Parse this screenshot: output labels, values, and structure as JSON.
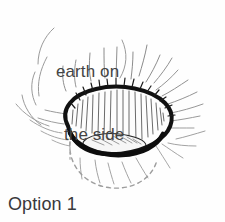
{
  "figure": {
    "title": "Option 1",
    "kind": "hand-drawn sketch diagram",
    "background_color": "#fefefe",
    "ink_color": "#1a1a1a",
    "sketch_line_color": "#8d8d8d",
    "text_color": "#3b3b3b"
  },
  "annotation": {
    "label_line_1": "earth on",
    "label_line_2": "the side",
    "full_text": "earth on the side",
    "leader_line_color": "#9a9a9a"
  },
  "caption": {
    "text": "Option 1"
  },
  "drawing": {
    "rim_label": "crater-rim",
    "rim_stroke_color": "#111111",
    "rim_stroke_width": 4,
    "inner_wall_label": "crater-inner-wall-hatching",
    "hatch_color": "#4a4a4a",
    "floor_label": "crater-floor",
    "hidden_outline_label": "hidden-bottom-dashed",
    "hidden_outline_style": "dashed",
    "hidden_outline_color": "#9d9d9d",
    "radiating_lines_label": "radiating-earth-strokes",
    "radiating_lines_count": 34
  }
}
